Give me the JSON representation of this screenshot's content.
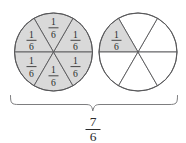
{
  "figure": {
    "total_label": {
      "numerator": "7",
      "denominator": "6"
    },
    "circles": [
      {
        "name": "left-circle",
        "shaded_count": 6,
        "total_parts": 6,
        "sectors": [
          {
            "index": 0,
            "shaded": true,
            "numerator": "1",
            "denominator": "6"
          },
          {
            "index": 1,
            "shaded": true,
            "numerator": "1",
            "denominator": "6"
          },
          {
            "index": 2,
            "shaded": true,
            "numerator": "1",
            "denominator": "6"
          },
          {
            "index": 3,
            "shaded": true,
            "numerator": "1",
            "denominator": "6"
          },
          {
            "index": 4,
            "shaded": true,
            "numerator": "1",
            "denominator": "6"
          },
          {
            "index": 5,
            "shaded": true,
            "numerator": "1",
            "denominator": "6"
          }
        ]
      },
      {
        "name": "right-circle",
        "shaded_count": 1,
        "total_parts": 6,
        "sectors": [
          {
            "index": 0,
            "shaded": false,
            "numerator": "",
            "denominator": ""
          },
          {
            "index": 1,
            "shaded": false,
            "numerator": "",
            "denominator": ""
          },
          {
            "index": 2,
            "shaded": true,
            "numerator": "1",
            "denominator": "6"
          },
          {
            "index": 3,
            "shaded": false,
            "numerator": "",
            "denominator": ""
          },
          {
            "index": 4,
            "shaded": false,
            "numerator": "",
            "denominator": ""
          },
          {
            "index": 5,
            "shaded": false,
            "numerator": "",
            "denominator": ""
          }
        ]
      }
    ],
    "colors": {
      "shaded_fill": "#d9d9d9",
      "empty_fill": "#ffffff",
      "line": "#58585a",
      "brace": "#6e6e70",
      "text": "#2b2b2b",
      "background": "#ffffff"
    }
  }
}
